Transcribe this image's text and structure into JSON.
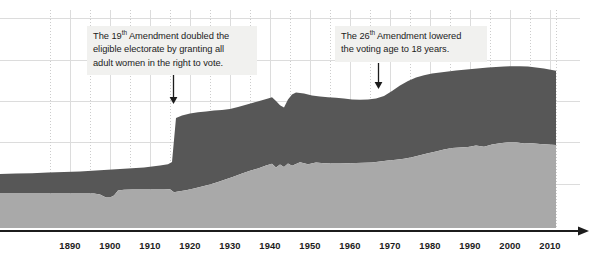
{
  "chart_data": {
    "type": "area",
    "title": "",
    "subtitle": "",
    "xlabel": "",
    "ylabel": "",
    "stacked": true,
    "grid": true,
    "legend_position": "none",
    "xlim": [
      1884,
      2016
    ],
    "ylim": [
      0,
      100
    ],
    "x_tick_labels": [
      "1890",
      "1900",
      "1910",
      "1920",
      "1930",
      "1940",
      "1950",
      "1960",
      "1970",
      "1980",
      "1990",
      "2000",
      "2010"
    ],
    "x_tick_values": [
      1890,
      1900,
      1910,
      1920,
      1930,
      1940,
      1950,
      1960,
      1970,
      1980,
      1990,
      2000,
      2010
    ],
    "x": [
      1884,
      1888,
      1892,
      1896,
      1900,
      1904,
      1908,
      1912,
      1916,
      1920,
      1924,
      1928,
      1932,
      1936,
      1940,
      1944,
      1948,
      1952,
      1956,
      1960,
      1964,
      1968,
      1972,
      1976,
      1980,
      1984,
      1988,
      1992,
      1996,
      2000,
      2004,
      2008,
      2012,
      2016
    ],
    "series": [
      {
        "name": "lower-band",
        "color": "#a9a9a9",
        "values": [
          22.0,
          22.0,
          22.2,
          22.4,
          22.6,
          20.4,
          20.6,
          20.8,
          21.8,
          25.0,
          27.5,
          30.5,
          32.5,
          34.0,
          36.5,
          33.5,
          35.8,
          38.5,
          37.5,
          39.0,
          39.0,
          40.0,
          41.0,
          41.5,
          43.0,
          44.0,
          44.2,
          46.0,
          45.0,
          47.5,
          47.0,
          47.5,
          47.0,
          47.0
        ]
      },
      {
        "name": "upper-band",
        "color": "#575757",
        "values": [
          12.5,
          12.8,
          13.0,
          13.2,
          14.0,
          16.2,
          16.4,
          17.0,
          17.2,
          34.0,
          33.0,
          32.5,
          33.0,
          33.8,
          34.0,
          31.5,
          35.0,
          34.0,
          35.0,
          35.0,
          35.5,
          35.0,
          38.5,
          40.0,
          41.5,
          42.0,
          42.5,
          42.0,
          43.5,
          42.5,
          44.0,
          44.5,
          43.5,
          43.0
        ]
      }
    ],
    "annotations": [
      {
        "id": "annotation-19th",
        "text": "The 19th Amendment doubled the\neligible electorate by granting all\nadult women in the right to vote.",
        "superscript": "th",
        "pointer_x_year": 1920,
        "pointer_kind": "down-arrow"
      },
      {
        "id": "annotation-26th",
        "text": "The 26th Amendment lowered\nthe voting age to 18 years.",
        "superscript": "th",
        "pointer_x_year": 1971,
        "pointer_kind": "down-arrow"
      }
    ]
  },
  "annotations": {
    "amendment_19": {
      "line1": "The 19",
      "sup1": "th",
      "line1b": " Amendment doubled the",
      "line2": "eligible electorate by granting all",
      "line3": "adult women in the right to vote."
    },
    "amendment_26": {
      "line1": "The 26",
      "sup1": "th",
      "line1b": " Amendment lowered",
      "line2": "the voting age to 18 years."
    }
  },
  "axis": {
    "ticks": [
      {
        "label": "1890",
        "x": 70
      },
      {
        "label": "1900",
        "x": 110
      },
      {
        "label": "1910",
        "x": 150
      },
      {
        "label": "1920",
        "x": 190
      },
      {
        "label": "1930",
        "x": 230
      },
      {
        "label": "1940",
        "x": 270
      },
      {
        "label": "1950",
        "x": 310
      },
      {
        "label": "1960",
        "x": 350
      },
      {
        "label": "1970",
        "x": 390
      },
      {
        "label": "1980",
        "x": 430
      },
      {
        "label": "1990",
        "x": 470
      },
      {
        "label": "2000",
        "x": 510
      },
      {
        "label": "2010",
        "x": 550
      }
    ]
  },
  "colors": {
    "band_upper": "#575757",
    "band_lower": "#a9a9a9",
    "grid": "#d8d8d8",
    "grid_dotted": "#c8c8c8",
    "axis": "#1c1c1c",
    "annotation_bg": "#f1f1ef",
    "text": "#1c1c1c",
    "background": "#ffffff"
  }
}
